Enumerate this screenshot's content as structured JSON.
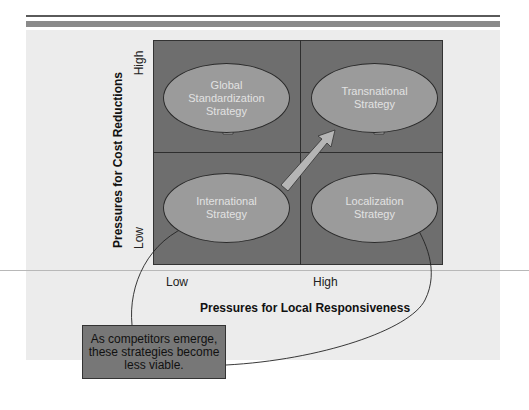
{
  "diagram": {
    "y_axis": {
      "title": "Pressures for Cost Reductions",
      "high_label": "High",
      "low_label": "Low"
    },
    "x_axis": {
      "title": "Pressures for Local Responsiveness",
      "low_label": "Low",
      "high_label": "High"
    },
    "quadrants": {
      "top_left": "Global Standardization Strategy",
      "top_right": "Transnational Strategy",
      "bottom_left": "International Strategy",
      "bottom_right": "Localization Strategy"
    },
    "quadrant_lines": {
      "top_left": [
        "Global",
        "Standardization",
        "Strategy"
      ],
      "top_right": [
        "Transnational",
        "Strategy"
      ],
      "bottom_left": [
        "International",
        "Strategy"
      ],
      "bottom_right": [
        "Localization",
        "Strategy"
      ]
    },
    "arrows": [
      {
        "from": "International Strategy",
        "to": "Global Standardization Strategy",
        "direction": "up"
      },
      {
        "from": "International Strategy",
        "to": "Transnational Strategy",
        "direction": "diagonal"
      },
      {
        "from": "Localization Strategy",
        "to": "Transnational Strategy",
        "direction": "up"
      }
    ],
    "note": {
      "text": "As competitors emerge, these strategies become less viable.",
      "lines": [
        "As competitors emerge,",
        "these strategies become",
        "less viable."
      ],
      "points_to": [
        "International Strategy",
        "Localization Strategy"
      ]
    },
    "colors": {
      "grid": "#6e6e6e",
      "ellipse": "#9b9b9b",
      "arrow": "#b5b5b5",
      "panel": "#ececec",
      "note": "#777777"
    }
  }
}
